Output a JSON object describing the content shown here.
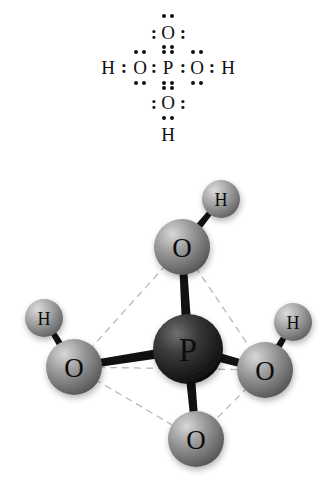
{
  "figure": {
    "formula": "H3PO4",
    "panels": [
      "lewis-dot-structure",
      "ball-and-stick-model"
    ],
    "background_color": "#ffffff"
  },
  "lewis": {
    "description": "Lewis electron-dot structure of phosphoric acid",
    "atoms": [
      {
        "id": "o-top",
        "label": "O",
        "x": 168,
        "y": 33
      },
      {
        "id": "h-left",
        "label": "H",
        "x": 108,
        "y": 68
      },
      {
        "id": "o-left",
        "label": "O",
        "x": 140,
        "y": 68
      },
      {
        "id": "p-center",
        "label": "P",
        "x": 168,
        "y": 68
      },
      {
        "id": "o-right",
        "label": "O",
        "x": 197,
        "y": 68
      },
      {
        "id": "h-right",
        "label": "H",
        "x": 228,
        "y": 68
      },
      {
        "id": "o-bottom",
        "label": "O",
        "x": 168,
        "y": 103
      },
      {
        "id": "h-bottom",
        "label": "H",
        "x": 168,
        "y": 135
      }
    ],
    "colons": [
      {
        "id": "colon-h-left-o",
        "label": ":",
        "x": 124,
        "y": 67
      },
      {
        "id": "colon-o-left-p",
        "label": ":",
        "x": 154,
        "y": 67
      },
      {
        "id": "colon-p-o-right",
        "label": ":",
        "x": 183,
        "y": 67
      },
      {
        "id": "colon-o-right-h",
        "label": ":",
        "x": 212,
        "y": 67
      },
      {
        "id": "colon-o-top-left",
        "label": ":",
        "x": 154,
        "y": 33
      },
      {
        "id": "colon-o-top-right",
        "label": ":",
        "x": 183,
        "y": 33
      },
      {
        "id": "colon-o-bot-left",
        "label": ":",
        "x": 154,
        "y": 103
      },
      {
        "id": "colon-o-bot-right",
        "label": ":",
        "x": 183,
        "y": 103
      }
    ],
    "dot_pairs_horizontal": [
      {
        "id": "dots-above-o-top",
        "x": 168,
        "y": 16
      },
      {
        "id": "dots-below-o-top",
        "x": 168,
        "y": 47
      },
      {
        "id": "dots-above-o-left",
        "x": 140,
        "y": 52
      },
      {
        "id": "dots-below-o-left",
        "x": 140,
        "y": 83
      },
      {
        "id": "dots-above-p",
        "x": 168,
        "y": 52
      },
      {
        "id": "dots-below-p",
        "x": 168,
        "y": 83
      },
      {
        "id": "dots-above-o-right",
        "x": 197,
        "y": 52
      },
      {
        "id": "dots-below-o-right",
        "x": 197,
        "y": 83
      },
      {
        "id": "dots-above-o-bottom",
        "x": 168,
        "y": 88
      },
      {
        "id": "dots-below-o-bottom",
        "x": 168,
        "y": 118
      }
    ]
  },
  "model": {
    "description": "Ball-and-stick tetrahedral model of phosphoric acid",
    "colors": {
      "phosphorus": "#2b2b2b",
      "oxygen": "#8d8d8d",
      "hydrogen": "#9a9a9a",
      "bond": "#111111",
      "guide_line": "#b9b9b9"
    },
    "atoms": [
      {
        "id": "p",
        "label": "P",
        "element": "P",
        "cx": 188,
        "cy": 194,
        "r": 35
      },
      {
        "id": "o-top",
        "label": "O",
        "element": "O",
        "cx": 182,
        "cy": 92,
        "r": 28
      },
      {
        "id": "o-left",
        "label": "O",
        "element": "O",
        "cx": 74,
        "cy": 212,
        "r": 28
      },
      {
        "id": "o-right",
        "label": "O",
        "element": "O",
        "cx": 265,
        "cy": 215,
        "r": 28
      },
      {
        "id": "o-bottom",
        "label": "O",
        "element": "O",
        "cx": 196,
        "cy": 284,
        "r": 28
      },
      {
        "id": "h-top",
        "label": "H",
        "element": "H",
        "cx": 221,
        "cy": 44,
        "r": 19
      },
      {
        "id": "h-left",
        "label": "H",
        "element": "H",
        "cx": 44,
        "cy": 163,
        "r": 19
      },
      {
        "id": "h-right",
        "label": "H",
        "element": "H",
        "cx": 293,
        "cy": 167,
        "r": 19
      }
    ],
    "bonds": [
      {
        "id": "bond-p-o-top",
        "from": "p",
        "to": "o-top",
        "style": "solid"
      },
      {
        "id": "bond-p-o-left",
        "from": "p",
        "to": "o-left",
        "style": "solid"
      },
      {
        "id": "bond-p-o-right",
        "from": "p",
        "to": "o-right",
        "style": "solid"
      },
      {
        "id": "bond-p-o-bottom",
        "from": "p",
        "to": "o-bottom",
        "style": "solid"
      },
      {
        "id": "bond-o-top-h",
        "from": "o-top",
        "to": "h-top",
        "style": "solid"
      },
      {
        "id": "bond-o-left-h",
        "from": "o-left",
        "to": "h-left",
        "style": "solid"
      },
      {
        "id": "bond-o-right-h",
        "from": "o-right",
        "to": "h-right",
        "style": "solid"
      }
    ],
    "guide_edges": [
      {
        "id": "edge-otop-oleft",
        "from": "o-top",
        "to": "o-left"
      },
      {
        "id": "edge-otop-oright",
        "from": "o-top",
        "to": "o-right"
      },
      {
        "id": "edge-otop-obottom",
        "from": "o-top",
        "to": "o-bottom"
      },
      {
        "id": "edge-oleft-oright",
        "from": "o-left",
        "to": "o-right"
      },
      {
        "id": "edge-oleft-obottom",
        "from": "o-left",
        "to": "o-bottom"
      },
      {
        "id": "edge-oright-obottom",
        "from": "o-right",
        "to": "o-bottom"
      }
    ]
  }
}
